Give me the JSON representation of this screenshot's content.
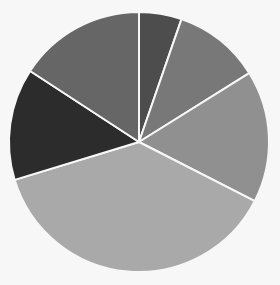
{
  "chart_data": {
    "type": "pie",
    "title": "",
    "start_angle_deg": 0,
    "direction": "clockwise",
    "legend": null,
    "labels_shown": false,
    "slices": [
      {
        "name": "Slice 1",
        "value": 5.3,
        "color": "#4d4d4d"
      },
      {
        "name": "Slice 2",
        "value": 10.8,
        "color": "#787878"
      },
      {
        "name": "Slice 3",
        "value": 16.4,
        "color": "#909090"
      },
      {
        "name": "Slice 4",
        "value": 37.8,
        "color": "#a9a9a9"
      },
      {
        "name": "Slice 5",
        "value": 13.9,
        "color": "#2c2c2c"
      },
      {
        "name": "Slice 6",
        "value": 15.8,
        "color": "#666666"
      }
    ],
    "values": [
      5.3,
      10.8,
      16.4,
      37.8,
      13.9,
      15.8
    ],
    "categories": [
      "Slice 1",
      "Slice 2",
      "Slice 3",
      "Slice 4",
      "Slice 5",
      "Slice 6"
    ]
  },
  "layout": {
    "cx": 139,
    "cy": 142,
    "r": 130,
    "background": "#f7f7f7"
  }
}
